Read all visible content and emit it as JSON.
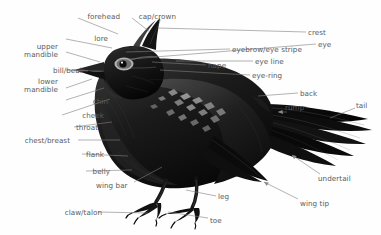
{
  "diagram": {
    "style": "black-and-white engraving illustration",
    "background_color": "#fefefe",
    "label_color": "#5a5a5a",
    "leader_line_color": "#808080",
    "bird_color": "#121212",
    "canvas": {
      "width": 381,
      "height": 235
    }
  },
  "labels": [
    {
      "id": "forehead",
      "text": "forehead",
      "side": "left",
      "x": 74,
      "y": 13,
      "align": "right",
      "line": [
        [
          78,
          18
        ],
        [
          118,
          34
        ]
      ]
    },
    {
      "id": "cap-crown",
      "text": "cap/crown",
      "side": "left",
      "x": 130,
      "y": 13,
      "align": "right",
      "line": [
        [
          132,
          18
        ],
        [
          150,
          32
        ]
      ]
    },
    {
      "id": "crest",
      "text": "crest",
      "side": "right",
      "x": 308,
      "y": 29,
      "align": "left",
      "line": [
        [
          306,
          32
        ],
        [
          158,
          28
        ]
      ]
    },
    {
      "id": "lore",
      "text": "lore",
      "side": "left",
      "x": 62,
      "y": 35,
      "align": "right",
      "line": [
        [
          66,
          39
        ],
        [
          112,
          48
        ]
      ]
    },
    {
      "id": "eye",
      "text": "eye",
      "side": "right",
      "x": 318,
      "y": 41,
      "align": "left",
      "line": [
        [
          316,
          44
        ],
        [
          118,
          60
        ]
      ]
    },
    {
      "id": "upper-mandible",
      "text": "upper mandible",
      "side": "left",
      "x": 12,
      "y": 43,
      "align": "right",
      "line": [
        [
          66,
          52
        ],
        [
          100,
          62
        ]
      ],
      "multiline": true
    },
    {
      "id": "eyebrow-eye-stripe",
      "text": "eyebrow/eye stripe",
      "side": "right",
      "x": 232,
      "y": 46,
      "align": "left",
      "line": [
        [
          230,
          49
        ],
        [
          126,
          52
        ]
      ]
    },
    {
      "id": "bill-beak",
      "text": "bill/beak",
      "side": "left",
      "x": 38,
      "y": 67,
      "align": "right",
      "line": [
        [
          66,
          70
        ],
        [
          88,
          71
        ]
      ]
    },
    {
      "id": "nape",
      "text": "nape",
      "side": "right",
      "x": 208,
      "y": 62,
      "align": "left",
      "line": [
        [
          206,
          65
        ],
        [
          152,
          62
        ]
      ]
    },
    {
      "id": "eye-line",
      "text": "eye line",
      "side": "right",
      "x": 255,
      "y": 58,
      "align": "left",
      "line": [
        [
          253,
          61
        ],
        [
          176,
          61
        ]
      ]
    },
    {
      "id": "eye-ring",
      "text": "eye-ring",
      "side": "right",
      "x": 252,
      "y": 72,
      "align": "left",
      "line": [
        [
          250,
          75
        ],
        [
          160,
          70
        ]
      ]
    },
    {
      "id": "lower-mandible",
      "text": "lower mandible",
      "side": "left",
      "x": 12,
      "y": 78,
      "align": "right",
      "line": [
        [
          66,
          88
        ],
        [
          92,
          79
        ]
      ],
      "multiline": true
    },
    {
      "id": "chin",
      "text": "chin",
      "side": "left",
      "x": 62,
      "y": 98,
      "align": "right",
      "line": [
        [
          66,
          100
        ],
        [
          104,
          88
        ]
      ]
    },
    {
      "id": "back",
      "text": "back",
      "side": "right",
      "x": 300,
      "y": 90,
      "align": "left",
      "line": [
        [
          298,
          93
        ],
        [
          258,
          96
        ]
      ]
    },
    {
      "id": "cheek",
      "text": "cheek",
      "side": "left",
      "x": 58,
      "y": 112,
      "align": "right",
      "line": [
        [
          62,
          115
        ],
        [
          110,
          99
        ]
      ]
    },
    {
      "id": "rump",
      "text": "rump",
      "side": "right",
      "x": 285,
      "y": 104,
      "align": "left",
      "line": [
        [
          287,
          112
        ],
        [
          278,
          112
        ]
      ]
    },
    {
      "id": "tail",
      "text": "tail",
      "side": "right",
      "x": 356,
      "y": 102,
      "align": "left",
      "line": [
        [
          355,
          108
        ],
        [
          330,
          118
        ]
      ]
    },
    {
      "id": "throat",
      "text": "throat",
      "side": "left",
      "x": 52,
      "y": 124,
      "align": "right",
      "line": [
        [
          74,
          127
        ],
        [
          112,
          122
        ]
      ]
    },
    {
      "id": "chest-breast",
      "text": "chest/breast",
      "side": "left",
      "x": 24,
      "y": 137,
      "align": "right",
      "line": [
        [
          78,
          140
        ],
        [
          120,
          140
        ]
      ]
    },
    {
      "id": "flank",
      "text": "flank",
      "side": "left",
      "x": 58,
      "y": 151,
      "align": "right",
      "line": [
        [
          82,
          154
        ],
        [
          128,
          156
        ]
      ]
    },
    {
      "id": "belly",
      "text": "belly",
      "side": "left",
      "x": 64,
      "y": 168,
      "align": "right",
      "line": [
        [
          86,
          171
        ],
        [
          132,
          170
        ]
      ]
    },
    {
      "id": "undertail",
      "text": "undertail",
      "side": "right",
      "x": 318,
      "y": 175,
      "align": "left",
      "line": [
        [
          320,
          174
        ],
        [
          292,
          155
        ]
      ]
    },
    {
      "id": "wing-bar",
      "text": "wing bar",
      "side": "left",
      "x": 96,
      "y": 182,
      "align": "left",
      "line": [
        [
          134,
          182
        ],
        [
          162,
          167
        ]
      ]
    },
    {
      "id": "leg",
      "text": "leg",
      "side": "right",
      "x": 218,
      "y": 193,
      "align": "left",
      "line": [
        [
          216,
          196
        ],
        [
          186,
          190
        ]
      ]
    },
    {
      "id": "wing-tip",
      "text": "wing tip",
      "side": "right",
      "x": 300,
      "y": 200,
      "align": "left",
      "line": [
        [
          298,
          199
        ],
        [
          264,
          182
        ]
      ]
    },
    {
      "id": "claw-talon",
      "text": "claw/talon",
      "side": "left",
      "x": 56,
      "y": 209,
      "align": "right",
      "line": [
        [
          98,
          212
        ],
        [
          148,
          213
        ]
      ]
    },
    {
      "id": "toe",
      "text": "toe",
      "side": "right",
      "x": 210,
      "y": 217,
      "align": "left",
      "line": [
        [
          208,
          218
        ],
        [
          168,
          212
        ]
      ]
    }
  ],
  "anatomy_parts": [
    "forehead",
    "cap/crown",
    "crest",
    "lore",
    "eye",
    "upper mandible",
    "eyebrow/eye stripe",
    "bill/beak",
    "nape",
    "eye line",
    "eye-ring",
    "lower mandible",
    "chin",
    "back",
    "cheek",
    "rump",
    "tail",
    "throat",
    "chest/breast",
    "flank",
    "belly",
    "undertail",
    "wing bar",
    "leg",
    "wing tip",
    "claw/talon",
    "toe"
  ]
}
